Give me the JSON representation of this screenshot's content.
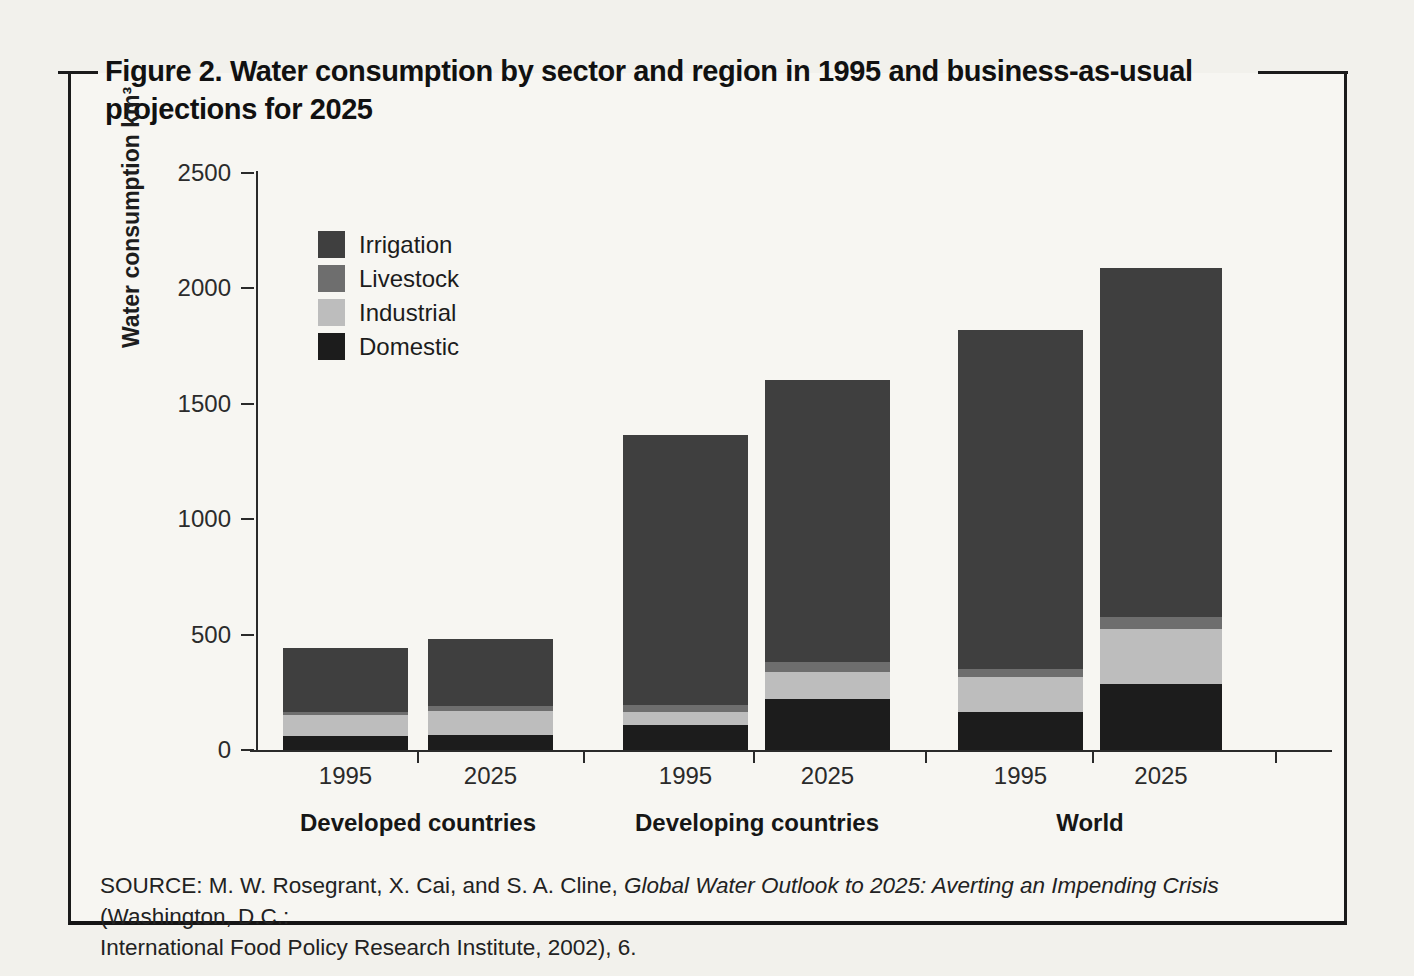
{
  "figure": {
    "title_line1": "Figure 2. Water consumption by sector and region in 1995 and business-as-usual",
    "title_line2": "projections for 2025",
    "source_prefix": "SOURCE: M. W. Rosegrant, X. Cai, and S. A. Cline, ",
    "source_italic": "Global Water Outlook to 2025: Averting an Impending Crisis",
    "source_suffix": " (Washington, D.C.:",
    "source_line2": "International Food Policy Research Institute, 2002), 6."
  },
  "chart_data": {
    "type": "bar",
    "stacked": true,
    "title": "Figure 2. Water consumption by sector and region in 1995 and business-as-usual projections for 2025",
    "ylabel": "Water consumption km³",
    "unit": "km³",
    "ylim": [
      0,
      2500
    ],
    "yticks": [
      0,
      500,
      1000,
      1500,
      2000,
      2500
    ],
    "grid": false,
    "legend_position": "upper left inside plot",
    "stack_order_bottom_to_top": [
      "Domestic",
      "Industrial",
      "Livestock",
      "Irrigation"
    ],
    "sectors": [
      {
        "name": "Irrigation",
        "color": "#3f3f3f"
      },
      {
        "name": "Livestock",
        "color": "#6e6e6e"
      },
      {
        "name": "Industrial",
        "color": "#bdbdbd"
      },
      {
        "name": "Domestic",
        "color": "#1c1c1c"
      }
    ],
    "groups": [
      {
        "label": "Developed countries",
        "bars": [
          {
            "year": "1995",
            "total": 440,
            "values": {
              "Irrigation": 275,
              "Livestock": 15,
              "Industrial": 90,
              "Domestic": 60
            }
          },
          {
            "year": "2025",
            "total": 480,
            "values": {
              "Irrigation": 290,
              "Livestock": 20,
              "Industrial": 105,
              "Domestic": 65
            }
          }
        ]
      },
      {
        "label": "Developing countries",
        "bars": [
          {
            "year": "1995",
            "total": 1365,
            "values": {
              "Irrigation": 1170,
              "Livestock": 30,
              "Industrial": 55,
              "Domestic": 110
            }
          },
          {
            "year": "2025",
            "total": 1605,
            "values": {
              "Irrigation": 1225,
              "Livestock": 40,
              "Industrial": 120,
              "Domestic": 220
            }
          }
        ]
      },
      {
        "label": "World",
        "bars": [
          {
            "year": "1995",
            "total": 1820,
            "values": {
              "Irrigation": 1470,
              "Livestock": 35,
              "Industrial": 150,
              "Domestic": 165
            }
          },
          {
            "year": "2025",
            "total": 2090,
            "values": {
              "Irrigation": 1515,
              "Livestock": 50,
              "Industrial": 240,
              "Domestic": 285
            }
          }
        ]
      }
    ]
  }
}
